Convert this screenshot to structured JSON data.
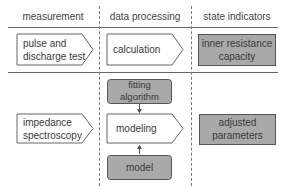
{
  "headers": {
    "col1": "measurement",
    "col2": "data processing",
    "col3": "state indicators"
  },
  "row1": {
    "measurement": [
      "pulse and",
      "discharge test"
    ],
    "processing": "calculation",
    "indicator": [
      "inner resistance",
      "capacity"
    ]
  },
  "row2": {
    "measurement": [
      "impedance",
      "spectroscopy"
    ],
    "fitting": [
      "fitting",
      "algorithm"
    ],
    "processing": "modeling",
    "model": "model",
    "indicator": [
      "adjusted",
      "parameters"
    ]
  },
  "colors": {
    "gray_box": "#a9a9a9",
    "white_box": "#ffffff",
    "stroke": "#555555"
  }
}
